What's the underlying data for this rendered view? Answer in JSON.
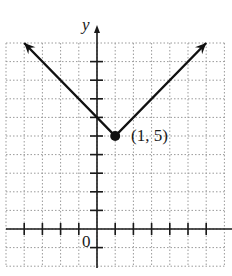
{
  "chart_data": {
    "type": "line",
    "title": "",
    "xlabel": "",
    "ylabel": "y",
    "origin_label": "0",
    "xlim": [
      -5,
      7
    ],
    "ylim": [
      -2,
      10
    ],
    "grid": true,
    "function": "y = |x - 1| + 5",
    "series": [
      {
        "name": "absolute value graph",
        "x": [
          -4,
          1,
          6
        ],
        "y": [
          10,
          5,
          10
        ],
        "arrows": [
          "start",
          "end"
        ]
      }
    ],
    "points": [
      {
        "x": 1,
        "y": 5,
        "label": "(1, 5)"
      }
    ],
    "x_ticks": [
      -4,
      -3,
      -2,
      -1,
      1,
      2,
      3,
      4,
      5,
      6
    ],
    "y_ticks": [
      -1,
      1,
      2,
      3,
      4,
      5,
      6,
      7,
      8,
      9
    ]
  },
  "labels": {
    "y_axis": "y",
    "origin": "0",
    "vertex": "(1, 5)"
  },
  "colors": {
    "axis": "#1a1a1a",
    "grid": "#9a9a9a",
    "curve": "#111111"
  }
}
